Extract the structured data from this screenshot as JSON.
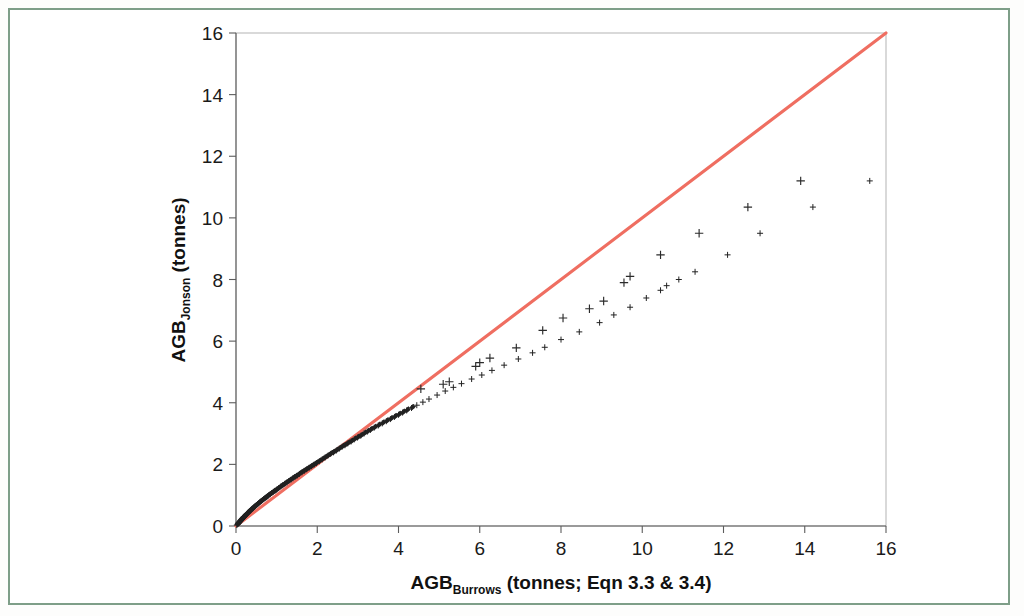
{
  "figure": {
    "frame_color": "#7e9e88",
    "background": "#ffffff"
  },
  "chart_data": {
    "type": "scatter",
    "title": "",
    "subtitle": "",
    "xlabel": "AGB_Burrows (tonnes; Eqn 3.3 & 3.4)",
    "xlabel_main": "AGB",
    "xlabel_subscript": "Burrows",
    "xlabel_tail": " (tonnes; Eqn 3.3 & 3.4)",
    "ylabel": "AGB_Jonson (tonnes)",
    "ylabel_main": "AGB",
    "ylabel_subscript": "Jonson",
    "ylabel_tail": " (tonnes)",
    "xlim": [
      0,
      16
    ],
    "ylim": [
      0,
      16
    ],
    "xticks": [
      0,
      2,
      4,
      6,
      8,
      10,
      12,
      14,
      16
    ],
    "yticks": [
      0,
      2,
      4,
      6,
      8,
      10,
      12,
      14,
      16
    ],
    "xtick_labels": [
      "0",
      "2",
      "4",
      "6",
      "8",
      "10",
      "12",
      "14",
      "16"
    ],
    "ytick_labels": [
      "0",
      "2",
      "4",
      "6",
      "8",
      "10",
      "12",
      "14",
      "16"
    ],
    "grid": false,
    "legend": null,
    "legend_position": "none",
    "marker_symbol": "plus",
    "marker_color": "#2b2b2b",
    "series": [
      {
        "name": "AGB Jonson vs AGB Burrows",
        "marker": "plus",
        "color": "#2b2b2b",
        "points": [
          [
            0.02,
            0.03
          ],
          [
            0.04,
            0.06
          ],
          [
            0.05,
            0.08
          ],
          [
            0.06,
            0.1
          ],
          [
            0.07,
            0.11
          ],
          [
            0.08,
            0.13
          ],
          [
            0.09,
            0.14
          ],
          [
            0.1,
            0.16
          ],
          [
            0.11,
            0.17
          ],
          [
            0.12,
            0.19
          ],
          [
            0.13,
            0.2
          ],
          [
            0.14,
            0.22
          ],
          [
            0.15,
            0.23
          ],
          [
            0.16,
            0.25
          ],
          [
            0.17,
            0.26
          ],
          [
            0.18,
            0.28
          ],
          [
            0.19,
            0.29
          ],
          [
            0.2,
            0.31
          ],
          [
            0.22,
            0.33
          ],
          [
            0.24,
            0.36
          ],
          [
            0.26,
            0.38
          ],
          [
            0.28,
            0.41
          ],
          [
            0.3,
            0.44
          ],
          [
            0.32,
            0.46
          ],
          [
            0.34,
            0.49
          ],
          [
            0.36,
            0.51
          ],
          [
            0.38,
            0.54
          ],
          [
            0.4,
            0.56
          ],
          [
            0.42,
            0.58
          ],
          [
            0.44,
            0.61
          ],
          [
            0.46,
            0.63
          ],
          [
            0.48,
            0.65
          ],
          [
            0.5,
            0.68
          ],
          [
            0.53,
            0.71
          ],
          [
            0.56,
            0.74
          ],
          [
            0.59,
            0.78
          ],
          [
            0.62,
            0.81
          ],
          [
            0.65,
            0.84
          ],
          [
            0.68,
            0.87
          ],
          [
            0.71,
            0.9
          ],
          [
            0.74,
            0.93
          ],
          [
            0.77,
            0.96
          ],
          [
            0.8,
            0.99
          ],
          [
            0.84,
            1.03
          ],
          [
            0.88,
            1.07
          ],
          [
            0.92,
            1.11
          ],
          [
            0.96,
            1.14
          ],
          [
            1.0,
            1.18
          ],
          [
            1.05,
            1.23
          ],
          [
            1.1,
            1.28
          ],
          [
            1.15,
            1.32
          ],
          [
            1.2,
            1.37
          ],
          [
            1.25,
            1.41
          ],
          [
            1.3,
            1.46
          ],
          [
            1.35,
            1.5
          ],
          [
            1.4,
            1.55
          ],
          [
            1.45,
            1.59
          ],
          [
            1.5,
            1.63
          ],
          [
            1.56,
            1.69
          ],
          [
            1.62,
            1.74
          ],
          [
            1.68,
            1.79
          ],
          [
            1.74,
            1.84
          ],
          [
            1.8,
            1.89
          ],
          [
            1.86,
            1.94
          ],
          [
            1.92,
            1.99
          ],
          [
            1.98,
            2.04
          ],
          [
            2.05,
            2.1
          ],
          [
            2.12,
            2.16
          ],
          [
            2.19,
            2.22
          ],
          [
            2.26,
            2.28
          ],
          [
            2.33,
            2.34
          ],
          [
            2.4,
            2.39
          ],
          [
            2.47,
            2.45
          ],
          [
            2.54,
            2.51
          ],
          [
            2.61,
            2.57
          ],
          [
            2.68,
            2.62
          ],
          [
            2.75,
            2.68
          ],
          [
            2.83,
            2.74
          ],
          [
            2.91,
            2.81
          ],
          [
            2.99,
            2.87
          ],
          [
            3.07,
            2.93
          ],
          [
            3.15,
            3.0
          ],
          [
            3.23,
            3.06
          ],
          [
            3.31,
            3.12
          ],
          [
            3.4,
            3.19
          ],
          [
            3.5,
            3.26
          ],
          [
            3.6,
            3.33
          ],
          [
            3.7,
            3.4
          ],
          [
            3.8,
            3.47
          ],
          [
            3.9,
            3.54
          ],
          [
            4.0,
            3.61
          ],
          [
            4.1,
            3.68
          ],
          [
            4.2,
            3.75
          ],
          [
            4.32,
            3.83
          ],
          [
            4.45,
            3.92
          ],
          [
            4.6,
            4.02
          ],
          [
            4.75,
            4.12
          ],
          [
            4.95,
            4.25
          ],
          [
            5.15,
            4.38
          ],
          [
            5.35,
            4.5
          ],
          [
            5.55,
            4.62
          ],
          [
            5.8,
            4.77
          ],
          [
            6.05,
            4.9
          ],
          [
            6.3,
            5.05
          ],
          [
            6.6,
            5.22
          ],
          [
            6.95,
            5.42
          ],
          [
            7.3,
            5.62
          ],
          [
            7.6,
            5.8
          ],
          [
            8.0,
            6.05
          ],
          [
            8.45,
            6.3
          ],
          [
            8.95,
            6.6
          ],
          [
            9.3,
            6.85
          ],
          [
            9.7,
            7.1
          ],
          [
            10.1,
            7.4
          ],
          [
            10.45,
            7.65
          ],
          [
            10.6,
            7.8
          ],
          [
            10.9,
            8.0
          ],
          [
            11.3,
            8.25
          ],
          [
            12.1,
            8.8
          ],
          [
            12.9,
            9.5
          ],
          [
            14.2,
            10.35
          ],
          [
            15.6,
            11.2
          ]
        ]
      }
    ],
    "reference_line": {
      "name": "1:1 line",
      "color": "#ef6e61",
      "width": 3,
      "from": [
        0,
        0
      ],
      "to": [
        16,
        16
      ]
    },
    "outlier_points": [
      [
        4.55,
        4.45
      ],
      [
        5.1,
        4.6
      ],
      [
        5.25,
        4.68
      ],
      [
        5.9,
        5.18
      ],
      [
        6.0,
        5.3
      ],
      [
        6.25,
        5.45
      ],
      [
        6.9,
        5.78
      ],
      [
        7.55,
        6.35
      ],
      [
        8.05,
        6.75
      ],
      [
        8.7,
        7.05
      ],
      [
        9.05,
        7.3
      ],
      [
        9.55,
        7.9
      ],
      [
        9.7,
        8.1
      ],
      [
        10.45,
        8.8
      ],
      [
        11.4,
        9.5
      ],
      [
        12.6,
        10.35
      ],
      [
        13.9,
        11.2
      ]
    ]
  }
}
